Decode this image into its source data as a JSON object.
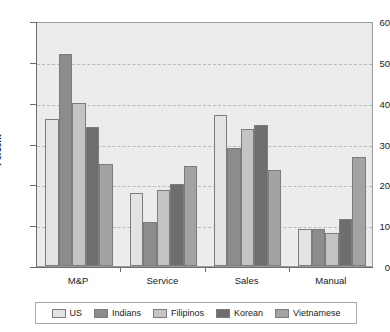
{
  "chart_data": {
    "type": "bar",
    "title": "",
    "xlabel": "",
    "ylabel": "Percent",
    "ylim": [
      0,
      60
    ],
    "yticks": [
      0,
      10,
      20,
      30,
      40,
      50,
      60
    ],
    "grid": true,
    "legend_position": "bottom",
    "categories": [
      "M&P",
      "Service",
      "Sales",
      "Manual"
    ],
    "series": [
      {
        "name": "US",
        "color": "#e3e3e3",
        "values": [
          36.0,
          18.0,
          37.0,
          9.0
        ]
      },
      {
        "name": "Indians",
        "color": "#8c8c8c",
        "values": [
          52.0,
          10.7,
          29.0,
          9.0
        ]
      },
      {
        "name": "Filipinos",
        "color": "#c4c4c4",
        "values": [
          40.0,
          18.5,
          33.5,
          8.2
        ]
      },
      {
        "name": "Korean",
        "color": "#6e6e6e",
        "values": [
          34.0,
          20.0,
          34.5,
          11.5
        ]
      },
      {
        "name": "Vietnamese",
        "color": "#a3a3a3",
        "values": [
          25.0,
          24.4,
          23.5,
          26.7
        ]
      }
    ]
  },
  "axis": {
    "y_title": "Percent",
    "y_labels": [
      "0",
      "10",
      "20",
      "30",
      "40",
      "50",
      "60"
    ],
    "x_labels": [
      "M&P",
      "Service",
      "Sales",
      "Manual"
    ]
  },
  "legend": {
    "items": [
      {
        "label": "US"
      },
      {
        "label": "Indians"
      },
      {
        "label": "Filipinos"
      },
      {
        "label": "Korean"
      },
      {
        "label": "Vietnamese"
      }
    ]
  }
}
